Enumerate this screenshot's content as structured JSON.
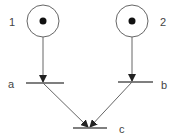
{
  "diagram": {
    "type": "petri-net",
    "colors": {
      "stroke": "#555555",
      "token": "#111111",
      "label": "#444444"
    },
    "places": [
      {
        "id": "1",
        "label": "1",
        "tokens": 1
      },
      {
        "id": "2",
        "label": "2",
        "tokens": 1
      }
    ],
    "transitions": [
      {
        "id": "a",
        "label": "a"
      },
      {
        "id": "b",
        "label": "b"
      },
      {
        "id": "c",
        "label": "c"
      }
    ],
    "arcs": [
      {
        "from": "1",
        "to": "a"
      },
      {
        "from": "2",
        "to": "b"
      },
      {
        "from": "a",
        "to": "c"
      },
      {
        "from": "b",
        "to": "c"
      }
    ]
  }
}
